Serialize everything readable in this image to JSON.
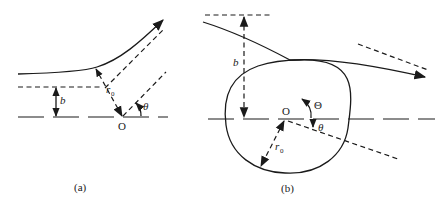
{
  "figure": {
    "panel_a": {
      "caption": "(a)",
      "labels": {
        "impact_parameter": "b",
        "closest_distance": "r",
        "closest_distance_sub": "0",
        "origin": "O",
        "scattering_angle": "θ"
      }
    },
    "panel_b": {
      "caption": "(b)",
      "labels": {
        "impact_parameter": "b",
        "radius": "r",
        "radius_sub": "0",
        "origin": "O",
        "deflection_angle": "Θ",
        "scattering_angle": "θ"
      }
    },
    "colors": {
      "ink": "#1a1a1a",
      "background": "#ffffff"
    }
  }
}
